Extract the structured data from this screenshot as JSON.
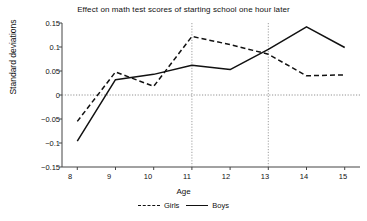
{
  "chart_data": {
    "type": "line",
    "title": "Effect on math test scores of starting school one hour later",
    "xlabel": "Age",
    "ylabel": "Standard deviations",
    "x": [
      8,
      9,
      10,
      11,
      12,
      13,
      14,
      15
    ],
    "xticklabels": [
      "8",
      "9",
      "10",
      "11",
      "12",
      "13",
      "14",
      "15"
    ],
    "yticklabels": [
      "0.15",
      "0.1",
      "0.05",
      "0",
      "−0.05",
      "−0.1",
      "−0.15"
    ],
    "yticks": [
      0.15,
      0.1,
      0.05,
      0,
      -0.05,
      -0.1,
      -0.15
    ],
    "xlim": [
      7.6,
      15.4
    ],
    "ylim": [
      -0.15,
      0.15
    ],
    "grid": false,
    "zero_line": true,
    "reference_lines_x": [
      11,
      13
    ],
    "legend_position": "bottom",
    "series": [
      {
        "name": "Girls",
        "style": "dashed",
        "color": "#111111",
        "values": [
          -0.055,
          0.048,
          0.018,
          0.122,
          0.105,
          0.085,
          0.04,
          0.042
        ]
      },
      {
        "name": "Boys",
        "style": "solid",
        "color": "#111111",
        "values": [
          -0.096,
          0.032,
          0.043,
          0.062,
          0.053,
          0.095,
          0.142,
          0.099
        ]
      }
    ]
  },
  "legend": {
    "girls_label": "Girls",
    "boys_label": "Boys"
  }
}
